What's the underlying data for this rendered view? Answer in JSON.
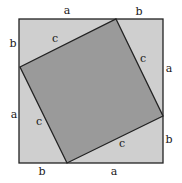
{
  "diagram": {
    "title": "",
    "colors": {
      "outer_fill": "#cfcfcf",
      "inner_fill": "#9a9a9a",
      "stroke": "#222222",
      "background": "#ffffff"
    },
    "labels": {
      "top_a": "a",
      "top_b": "b",
      "right_a": "a",
      "right_b": "b",
      "bottom_b": "b",
      "bottom_a": "a",
      "left_b": "b",
      "left_a": "a",
      "hyp_top": "c",
      "hyp_right": "c",
      "hyp_bottom": "c",
      "hyp_left": "c"
    }
  }
}
